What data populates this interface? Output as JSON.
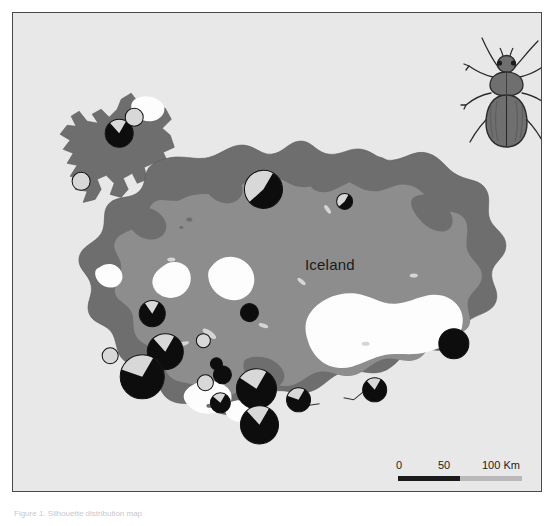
{
  "figure": {
    "caption": "Figure 1. Silhouette distribution map"
  },
  "map": {
    "region_label": "Iceland",
    "background_color": "#e8e8e8",
    "frame_color": "#4a4a4a",
    "lowland_color": "#6e6e6e",
    "highland_color": "#8d8d8d",
    "glacier_color": "#fdfdfd",
    "ocean_color": "#e8e8e8"
  },
  "scalebar": {
    "tick_0": "0",
    "tick_50": "50",
    "tick_100": "100 Km",
    "units": "Km",
    "length_km": 100,
    "segment_dark_color": "#1a1a1a",
    "segment_light_color": "#b9b9b9"
  },
  "inset": {
    "illustration_name": "ground-beetle",
    "body_color": "#6f6f6f",
    "outline_color": "#2b2b2b"
  },
  "legend": {
    "slice_present_color": "#0d0d0d",
    "slice_absent_color": "#d8d8d8",
    "marker_outline_color": "#111111"
  },
  "chart_data": {
    "type": "pie",
    "categories": [
      "present",
      "absent"
    ],
    "colors": [
      "#0d0d0d",
      "#d8d8d8"
    ],
    "sites": [
      {
        "id": "s01",
        "x": 106,
        "y": 120,
        "r": 14,
        "present": 0.8,
        "absent": 0.2
      },
      {
        "id": "s02",
        "x": 121,
        "y": 104,
        "r": 9,
        "present": 0.0,
        "absent": 1.0
      },
      {
        "id": "s03",
        "x": 68,
        "y": 168,
        "r": 9,
        "present": 0.0,
        "absent": 1.0
      },
      {
        "id": "s04",
        "x": 250,
        "y": 176,
        "r": 19,
        "present": 0.55,
        "absent": 0.45
      },
      {
        "id": "s05",
        "x": 331,
        "y": 188,
        "r": 8,
        "present": 0.55,
        "absent": 0.45
      },
      {
        "id": "s06",
        "x": 139,
        "y": 300,
        "r": 13,
        "present": 0.82,
        "absent": 0.18
      },
      {
        "id": "s07",
        "x": 236,
        "y": 299,
        "r": 9,
        "present": 1.0,
        "absent": 0.0
      },
      {
        "id": "s08",
        "x": 152,
        "y": 338,
        "r": 18,
        "present": 0.8,
        "absent": 0.2
      },
      {
        "id": "s09",
        "x": 97,
        "y": 342,
        "r": 8,
        "present": 0.0,
        "absent": 1.0
      },
      {
        "id": "s10",
        "x": 129,
        "y": 363,
        "r": 22,
        "present": 0.72,
        "absent": 0.28
      },
      {
        "id": "s11",
        "x": 192,
        "y": 369,
        "r": 8,
        "present": 0.0,
        "absent": 1.0
      },
      {
        "id": "s12",
        "x": 209,
        "y": 361,
        "r": 9,
        "present": 1.0,
        "absent": 0.0
      },
      {
        "id": "s13",
        "x": 243,
        "y": 375,
        "r": 20,
        "present": 0.76,
        "absent": 0.24
      },
      {
        "id": "s14",
        "x": 207,
        "y": 389,
        "r": 10,
        "present": 0.78,
        "absent": 0.22
      },
      {
        "id": "s15",
        "x": 246,
        "y": 411,
        "r": 19,
        "present": 0.8,
        "absent": 0.2
      },
      {
        "id": "s16",
        "x": 285,
        "y": 386,
        "r": 12,
        "present": 0.72,
        "absent": 0.28
      },
      {
        "id": "s17",
        "x": 361,
        "y": 376,
        "r": 12,
        "present": 0.8,
        "absent": 0.2
      },
      {
        "id": "s18",
        "x": 440,
        "y": 330,
        "r": 15,
        "present": 1.0,
        "absent": 0.0
      },
      {
        "id": "s19",
        "x": 190,
        "y": 327,
        "r": 7,
        "present": 0.0,
        "absent": 1.0
      },
      {
        "id": "s20",
        "x": 203,
        "y": 350,
        "r": 6,
        "present": 1.0,
        "absent": 0.0
      }
    ]
  }
}
